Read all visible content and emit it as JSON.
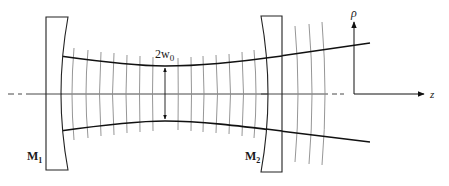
{
  "diagram": {
    "mirrors": [
      {
        "id": "M1",
        "label": "M",
        "subscript": "1"
      },
      {
        "id": "M2",
        "label": "M",
        "subscript": "2"
      }
    ],
    "waist_label": {
      "main": "2w",
      "subscript": "0"
    },
    "axes": {
      "vertical": "ρ",
      "horizontal": "z"
    },
    "colors": {
      "beam": "#111111",
      "wavefront": "#8a8a8a",
      "mirror": "#222222",
      "background": "#ffffff"
    }
  }
}
